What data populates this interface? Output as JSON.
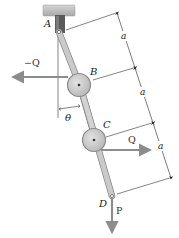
{
  "diagram": {
    "type": "mechanism",
    "points": {
      "A": {
        "label": "A"
      },
      "B": {
        "label": "B"
      },
      "C": {
        "label": "C"
      },
      "D": {
        "label": "D"
      }
    },
    "forces": {
      "neg_q": {
        "label": "−Q",
        "direction": "left",
        "at": "B"
      },
      "q": {
        "label": "Q",
        "direction": "right",
        "at": "C"
      },
      "p": {
        "label": "P",
        "direction": "down",
        "at": "D"
      }
    },
    "angle": {
      "label": "θ",
      "between": "vertical and link AB"
    },
    "dimensions": [
      {
        "label": "a",
        "from": "A",
        "to": "B"
      },
      {
        "label": "a",
        "from": "B",
        "to": "C"
      },
      {
        "label": "a",
        "from": "C",
        "to": "D"
      }
    ],
    "colors": {
      "ceiling": "#b8b8b8",
      "clevis": "#555555",
      "link": "#c9c9c9",
      "link_edge": "#888888",
      "roller": "#cfcfcf",
      "roller_edge": "#8a8a8a",
      "arrow": "#8c8c8c",
      "line": "#333333"
    }
  }
}
